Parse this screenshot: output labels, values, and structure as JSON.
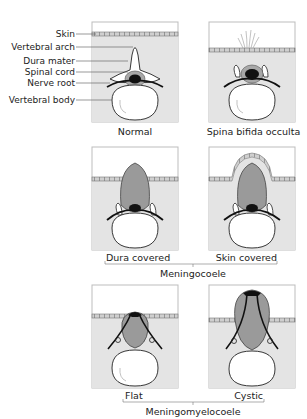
{
  "diagram": {
    "colors": {
      "tissue": "#e4e4e4",
      "sac": "#9a9a9a",
      "cord": "#111111",
      "outline": "#222222",
      "skin_line": "#777777",
      "bone": "#ffffff",
      "frame": "#bdbdbd"
    },
    "anatomy_labels": [
      {
        "text": "Skin"
      },
      {
        "text": "Vertebral arch"
      },
      {
        "text": "Dura mater"
      },
      {
        "text": "Spinal cord"
      },
      {
        "text": "Nerve root"
      },
      {
        "text": "Vertebral body"
      }
    ],
    "panels": [
      {
        "id": "normal",
        "caption": "Normal"
      },
      {
        "id": "occulta",
        "caption": "Spina bifida occulta"
      },
      {
        "id": "dura-covered",
        "caption": "Dura covered"
      },
      {
        "id": "skin-covered",
        "caption": "Skin covered"
      },
      {
        "id": "flat",
        "caption": "Flat"
      },
      {
        "id": "cystic",
        "caption": "Cystic"
      }
    ],
    "groups": [
      {
        "label": "Meningocoele"
      },
      {
        "label": "Meningomyelocoele"
      }
    ]
  }
}
